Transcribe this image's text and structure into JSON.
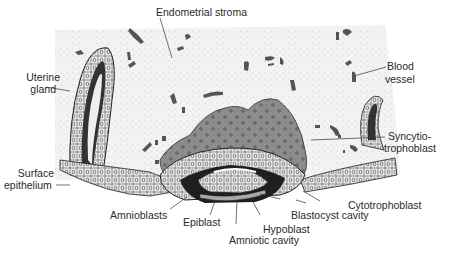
{
  "diagram": {
    "type": "anatomical illustration",
    "labels": {
      "endometrial_stroma": "Endometrial stroma",
      "uterine_gland_1": "Uterine",
      "uterine_gland_2": "gland",
      "blood_vessel_1": "Blood",
      "blood_vessel_2": "vessel",
      "syncytio_1": "Syncytio-",
      "syncytio_2": "trophoblast",
      "surface_epi_1": "Surface",
      "surface_epi_2": "epithelium",
      "cytotrophoblast": "Cytotrophoblast",
      "amnioblasts": "Amnioblasts",
      "epiblast": "Epiblast",
      "blastocyst_cavity": "Blastocyst cavity",
      "hypoblast": "Hypoblast",
      "amniotic_cavity": "Amniotic cavity"
    },
    "colors": {
      "stroma": "#f2f2f2",
      "vessel": "#555555",
      "syncytiotrophoblast": "#8a8a8a",
      "cell_fill": "#e6e6e6",
      "outline": "#222222",
      "text": "#2a2a2a"
    }
  }
}
